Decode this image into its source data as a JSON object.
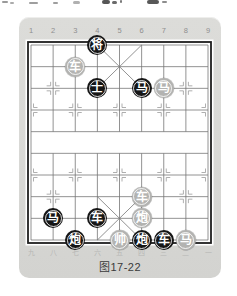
{
  "figure": {
    "caption": "图17-22"
  },
  "board": {
    "top_column_labels": [
      "1",
      "2",
      "3",
      "4",
      "5",
      "6",
      "7",
      "8",
      "9"
    ],
    "bottom_column_labels": [
      "九",
      "八",
      "七",
      "六",
      "五",
      "四",
      "三",
      "二",
      "一"
    ],
    "pieces": [
      {
        "label": "将",
        "side": "black",
        "col": 4,
        "row": 1
      },
      {
        "label": "车",
        "side": "gray",
        "col": 3,
        "row": 2
      },
      {
        "label": "士",
        "side": "black",
        "col": 4,
        "row": 3
      },
      {
        "label": "马",
        "side": "black",
        "col": 6,
        "row": 3
      },
      {
        "label": "马",
        "side": "gray",
        "col": 7,
        "row": 3
      },
      {
        "label": "车",
        "side": "gray",
        "col": 6,
        "row": 8
      },
      {
        "label": "马",
        "side": "black",
        "col": 2,
        "row": 9
      },
      {
        "label": "车",
        "side": "black",
        "col": 4,
        "row": 9
      },
      {
        "label": "炮",
        "side": "gray",
        "col": 6,
        "row": 9
      },
      {
        "label": "炮",
        "side": "black",
        "col": 3,
        "row": 10
      },
      {
        "label": "帅",
        "side": "gray",
        "col": 5,
        "row": 10
      },
      {
        "label": "炮",
        "side": "black",
        "col": 6,
        "row": 10
      },
      {
        "label": "车",
        "side": "black",
        "col": 7,
        "row": 10
      },
      {
        "label": "马",
        "side": "gray",
        "col": 8,
        "row": 10
      }
    ],
    "colors": {
      "black_piece": "#161616",
      "red_piece": "#b3b3b1",
      "piece_text": "#ffffff",
      "grid_line": "#767676",
      "board_border": "#1f1f1f",
      "card_background": "#d8d8d5",
      "marker": "#9a9a9a",
      "top_label_color": "#8f8f8f",
      "bottom_label_color": "#b7b7b5",
      "caption_color": "#3a3a3a"
    }
  }
}
